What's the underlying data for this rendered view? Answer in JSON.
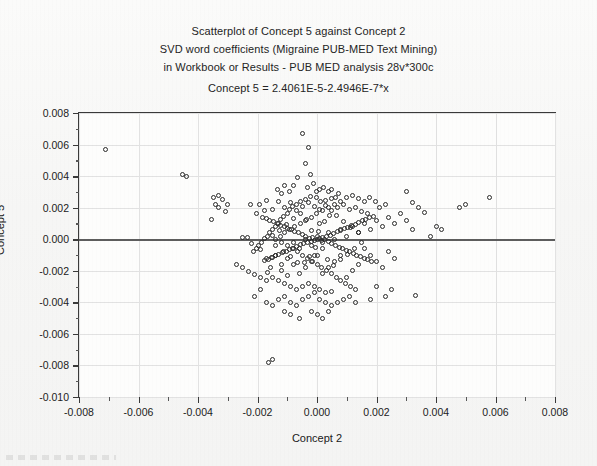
{
  "titles": {
    "line1": "Scatterplot of Concept 5 against Concept 2",
    "line2": "SVD word coefficients (Migraine PUB-MED Text Mining)",
    "line3": "in Workbook or  Results - PUB MED analysis 28v*300c",
    "equation": "Concept 5 = 2.4061E-5-2.4946E-7*x"
  },
  "chart_data": {
    "type": "scatter",
    "title": "Scatterplot of Concept 5 against Concept 2",
    "subtitle": "SVD word coefficients (Migraine PUB-MED Text Mining) in Workbook or  Results - PUB MED analysis 28v*300c",
    "annotation": "Concept 5 = 2.4061E-5-2.4946E-7*x",
    "xlabel": "Concept 2",
    "ylabel": "Concept 5",
    "xlim": [
      -0.008,
      0.008
    ],
    "ylim": [
      -0.01,
      0.008
    ],
    "xticks": [
      -0.008,
      -0.006,
      -0.004,
      -0.002,
      0.0,
      0.002,
      0.004,
      0.006,
      0.008
    ],
    "yticks": [
      0.008,
      0.006,
      0.004,
      0.002,
      0.0,
      -0.002,
      -0.004,
      -0.006,
      -0.008,
      -0.01
    ],
    "xticklabels": [
      "-0.008",
      "-0.006",
      "-0.004",
      "-0.002",
      "0.000",
      "0.002",
      "0.004",
      "0.006",
      "0.008"
    ],
    "yticklabels": [
      "0.008",
      "0.006",
      "0.004",
      "0.002",
      "0.000",
      "-0.002",
      "-0.004",
      "-0.006",
      "-0.008",
      "-0.010"
    ],
    "grid": true,
    "legend": false,
    "minor_ticks": true,
    "marker": "open-circle",
    "marker_color": "#2a2a2a",
    "fit_line": {
      "intercept": 2.4061e-05,
      "slope": -2.4946e-07,
      "color": "#5d5d5d",
      "label": "Concept 5 = 2.4061E-5-2.4946E-7*x"
    },
    "n_points": 300,
    "points": [
      [
        -0.0071,
        0.00568
      ],
      [
        -0.00452,
        0.00408
      ],
      [
        -0.0044,
        0.004
      ],
      [
        -0.0033,
        0.0028
      ],
      [
        -0.00348,
        0.00262
      ],
      [
        -0.00318,
        0.00252
      ],
      [
        -0.00342,
        0.00222
      ],
      [
        -0.003,
        0.00222
      ],
      [
        -0.00222,
        0.00222
      ],
      [
        -0.0033,
        0.002
      ],
      [
        -0.00308,
        0.00178
      ],
      [
        -0.00356,
        0.00128
      ],
      [
        -0.00252,
        0.00012
      ],
      [
        -0.00232,
        8e-05
      ],
      [
        -0.0022,
        -0.0003
      ],
      [
        -0.0019,
        -0.00062
      ],
      [
        -0.00148,
        -0.00118
      ],
      [
        -0.0017,
        -0.00122
      ],
      [
        -0.00156,
        -0.00182
      ],
      [
        -0.0012,
        -0.002
      ],
      [
        -0.00168,
        -0.00212
      ],
      [
        -0.001,
        -0.00228
      ],
      [
        -0.00192,
        0.00218
      ],
      [
        -0.0017,
        0.00248
      ],
      [
        -0.00178,
        0.00182
      ],
      [
        -0.00202,
        0.0016
      ],
      [
        -0.00148,
        0.00188
      ],
      [
        -0.00128,
        0.00238
      ],
      [
        -0.00118,
        0.00292
      ],
      [
        -0.00132,
        0.00318
      ],
      [
        -0.00108,
        0.00338
      ],
      [
        -0.00092,
        0.003
      ],
      [
        -0.0008,
        0.00338
      ],
      [
        -0.00066,
        0.00392
      ],
      [
        -0.00048,
        0.00668
      ],
      [
        -0.0003,
        0.00582
      ],
      [
        -0.0004,
        0.0048
      ],
      [
        -0.00022,
        0.00412
      ],
      [
        -0.00032,
        0.0033
      ],
      [
        -0.00012,
        0.00352
      ],
      [
        -2e-05,
        0.003
      ],
      [
        0.0001,
        0.00318
      ],
      [
        0.00022,
        0.0033
      ],
      [
        0.00038,
        0.003
      ],
      [
        0.0005,
        0.00318
      ],
      [
        0.00062,
        0.00262
      ],
      [
        0.00072,
        0.00288
      ],
      [
        0.00048,
        0.0026
      ],
      [
        0.0003,
        0.00248
      ],
      [
        0.00012,
        0.0024
      ],
      [
        -2e-05,
        0.00262
      ],
      [
        -0.00022,
        0.00272
      ],
      [
        -0.0004,
        0.00252
      ],
      [
        -0.00056,
        0.00238
      ],
      [
        -0.0007,
        0.00222
      ],
      [
        -0.00082,
        0.00208
      ],
      [
        -0.00092,
        0.00188
      ],
      [
        -0.001,
        0.00162
      ],
      [
        -0.00112,
        0.00142
      ],
      [
        -0.00122,
        0.00122
      ],
      [
        -0.0013,
        0.00102
      ],
      [
        -0.0014,
        0.00082
      ],
      [
        -0.0015,
        0.00062
      ],
      [
        -0.00158,
        0.00042
      ],
      [
        -0.00166,
        0.0002
      ],
      [
        -0.00176,
        2e-05
      ],
      [
        -0.00186,
        -0.00018
      ],
      [
        -0.00196,
        -0.00038
      ],
      [
        -0.00204,
        -0.00058
      ],
      [
        -0.00212,
        -0.00078
      ],
      [
        -0.0011,
        0.002
      ],
      [
        -0.0009,
        0.0023
      ],
      [
        -0.0007,
        0.0018
      ],
      [
        -0.0005,
        0.0021
      ],
      [
        -0.0003,
        0.0023
      ],
      [
        -0.0001,
        0.0021
      ],
      [
        0.0001,
        0.0019
      ],
      [
        0.0003,
        0.00212
      ],
      [
        0.0005,
        0.00182
      ],
      [
        0.0007,
        0.00198
      ],
      [
        0.0009,
        0.00218
      ],
      [
        0.0011,
        0.0019
      ],
      [
        0.0013,
        0.00202
      ],
      [
        0.0015,
        0.00178
      ],
      [
        0.0017,
        0.0016
      ],
      [
        0.0019,
        0.00142
      ],
      [
        0.0021,
        0.002
      ],
      [
        0.0023,
        0.00218
      ],
      [
        0.00198,
        0.00242
      ],
      [
        0.00178,
        0.00262
      ],
      [
        0.00158,
        0.00238
      ],
      [
        0.00138,
        0.00258
      ],
      [
        0.00118,
        0.00278
      ],
      [
        0.00098,
        0.00262
      ],
      [
        0.00078,
        0.0024
      ],
      [
        0.00058,
        0.00222
      ],
      [
        0.00038,
        0.002
      ],
      [
        0.00018,
        0.0018
      ],
      [
        -2e-05,
        0.0016
      ],
      [
        -0.0002,
        0.0014
      ],
      [
        -0.00038,
        0.0012
      ],
      [
        -0.00056,
        0.001
      ],
      [
        -0.00074,
        0.0008
      ],
      [
        -0.00092,
        0.0006
      ],
      [
        -0.00108,
        0.0004
      ],
      [
        -0.00124,
        0.0002
      ],
      [
        -0.0014,
        0.0
      ],
      [
        -0.0012,
        -0.0002
      ],
      [
        -0.001,
        -0.0004
      ],
      [
        -0.00082,
        -0.0006
      ],
      [
        -0.00064,
        -0.0008
      ],
      [
        -0.00048,
        -0.001
      ],
      [
        -0.00032,
        -0.0012
      ],
      [
        -0.00016,
        -0.0014
      ],
      [
        0.0,
        -0.0016
      ],
      [
        0.00016,
        -0.0018
      ],
      [
        0.00032,
        -0.002
      ],
      [
        0.00048,
        -0.0022
      ],
      [
        0.00064,
        -0.0024
      ],
      [
        0.0008,
        -0.0026
      ],
      [
        0.00096,
        -0.0028
      ],
      [
        0.00112,
        -0.003
      ],
      [
        0.00128,
        -0.0032
      ],
      [
        0.0005,
        -0.0033
      ],
      [
        0.0003,
        -0.0034
      ],
      [
        0.0001,
        -0.0032
      ],
      [
        -0.0001,
        -0.003
      ],
      [
        -0.0003,
        -0.0028
      ],
      [
        -0.0005,
        -0.003
      ],
      [
        -0.0007,
        -0.0032
      ],
      [
        -0.0009,
        -0.003
      ],
      [
        -0.0011,
        -0.0028
      ],
      [
        -0.0013,
        -0.0026
      ],
      [
        -0.0015,
        -0.0024
      ],
      [
        -0.0017,
        -0.00262
      ],
      [
        -0.0019,
        -0.00242
      ],
      [
        -0.0021,
        -0.00222
      ],
      [
        -0.0023,
        -0.00202
      ],
      [
        -0.0025,
        -0.0018
      ],
      [
        -0.0027,
        -0.0016
      ],
      [
        -0.0019,
        -0.0032
      ],
      [
        -0.0021,
        -0.0036
      ],
      [
        -0.0017,
        -0.004
      ],
      [
        -0.0015,
        -0.00418
      ],
      [
        -0.0013,
        -0.0038
      ],
      [
        -0.0011,
        -0.00362
      ],
      [
        -0.0009,
        -0.004
      ],
      [
        -0.0007,
        -0.0042
      ],
      [
        -0.0005,
        -0.0038
      ],
      [
        -0.0003,
        -0.0036
      ],
      [
        -0.0001,
        -0.0034
      ],
      [
        0.0001,
        -0.0038
      ],
      [
        0.0003,
        -0.004
      ],
      [
        0.0005,
        -0.0042
      ],
      [
        0.0007,
        -0.004
      ],
      [
        0.0009,
        -0.0038
      ],
      [
        0.0011,
        -0.0036
      ],
      [
        0.0013,
        -0.004
      ],
      [
        0.0018,
        -0.0038
      ],
      [
        0.0023,
        -0.0036
      ],
      [
        0.0033,
        -0.00358
      ],
      [
        -0.00162,
        -0.0078
      ],
      [
        -0.00148,
        -0.00762
      ],
      [
        -0.0006,
        -0.005
      ],
      [
        -0.0009,
        -0.0048
      ],
      [
        -0.0011,
        -0.0046
      ],
      [
        -0.0002,
        -0.0046
      ],
      [
        0.0,
        -0.0048
      ],
      [
        0.0002,
        -0.005
      ],
      [
        0.0004,
        -0.0046
      ],
      [
        0.002,
        -0.003
      ],
      [
        0.0025,
        -0.0032
      ],
      [
        0.0032,
        0.0006
      ],
      [
        0.0038,
        0.0002
      ],
      [
        0.004,
        0.0008
      ],
      [
        0.0042,
        0.0006
      ],
      [
        0.0048,
        0.002
      ],
      [
        0.005,
        0.0022
      ],
      [
        0.0058,
        0.00262
      ],
      [
        0.003,
        0.003
      ],
      [
        0.0032,
        0.0023
      ],
      [
        0.0034,
        0.002
      ],
      [
        0.0036,
        0.0017
      ],
      [
        0.003,
        0.0012
      ],
      [
        0.0028,
        0.0016
      ],
      [
        0.0026,
        0.001
      ],
      [
        0.0024,
        0.0014
      ],
      [
        0.0022,
        0.0008
      ],
      [
        0.002,
        0.0012
      ],
      [
        0.0018,
        0.0006
      ],
      [
        0.0016,
        0.001
      ],
      [
        0.0014,
        0.0004
      ],
      [
        0.0012,
        0.0008
      ],
      [
        0.001,
        0.0002
      ],
      [
        0.0008,
        0.0006
      ],
      [
        0.0006,
        0.0
      ],
      [
        0.0004,
        0.0004
      ],
      [
        0.0002,
        -0.0002
      ],
      [
        0.0,
        0.0002
      ],
      [
        -0.0002,
        -0.0004
      ],
      [
        -0.0004,
        0.0
      ],
      [
        -0.0006,
        -0.0006
      ],
      [
        -0.0008,
        -0.0002
      ],
      [
        0.0016,
        -0.0006
      ],
      [
        0.0018,
        -0.001
      ],
      [
        0.002,
        -0.0014
      ],
      [
        0.0022,
        -0.0018
      ],
      [
        0.0024,
        -0.0008
      ],
      [
        0.0026,
        -0.0012
      ],
      [
        0.0014,
        -0.0016
      ],
      [
        0.0012,
        -0.002
      ],
      [
        0.001,
        -0.0024
      ],
      [
        0.0008,
        -0.001
      ],
      [
        0.0006,
        -0.0014
      ],
      [
        0.0004,
        -0.0018
      ],
      [
        0.0002,
        -0.0022
      ],
      [
        0.0,
        -0.001
      ],
      [
        -0.0002,
        -0.0014
      ],
      [
        -0.0004,
        -0.0018
      ],
      [
        -0.0006,
        -0.0022
      ],
      [
        -0.0008,
        -0.0016
      ],
      [
        -0.001,
        -0.0012
      ],
      [
        -0.0012,
        -0.0016
      ],
      [
        -0.0014,
        -0.001
      ],
      [
        0.0,
        0.0
      ],
      [
        8e-05,
        6e-05
      ],
      [
        -8e-05,
        -6e-05
      ],
      [
        0.00014,
        -0.0001
      ],
      [
        -0.00014,
        0.0001
      ],
      [
        0.0002,
        0.00014
      ],
      [
        -0.0002,
        -0.00014
      ],
      [
        0.00026,
        -4e-05
      ],
      [
        -0.00026,
        4e-05
      ],
      [
        0.00032,
        0.0002
      ],
      [
        -0.00032,
        -0.0002
      ],
      [
        0.00038,
        -0.00016
      ],
      [
        -0.00038,
        0.00016
      ],
      [
        0.00044,
        0.00026
      ],
      [
        -0.00044,
        -0.00026
      ],
      [
        0.0005,
        -0.0003
      ],
      [
        -0.0005,
        0.0003
      ],
      [
        0.00056,
        0.00036
      ],
      [
        -0.00056,
        -0.00036
      ],
      [
        0.00062,
        -0.0004
      ],
      [
        -0.00062,
        0.0004
      ],
      [
        0.00068,
        0.00046
      ],
      [
        -0.00068,
        -0.00046
      ],
      [
        0.00074,
        -0.0005
      ],
      [
        -0.00074,
        0.0005
      ],
      [
        0.0008,
        0.00056
      ],
      [
        -0.0008,
        -0.00056
      ],
      [
        0.00086,
        -0.0006
      ],
      [
        -0.00086,
        0.0006
      ],
      [
        0.00092,
        0.00066
      ],
      [
        -0.00092,
        -0.00066
      ],
      [
        0.00098,
        -0.0007
      ],
      [
        -0.00098,
        0.0007
      ],
      [
        0.00104,
        0.00076
      ],
      [
        -0.00104,
        -0.00076
      ],
      [
        0.0011,
        -0.0008
      ],
      [
        -0.0011,
        0.0008
      ],
      [
        0.00116,
        0.00086
      ],
      [
        -0.00116,
        -0.00086
      ],
      [
        0.00122,
        -0.0009
      ],
      [
        -0.00122,
        0.0009
      ],
      [
        0.00128,
        0.00096
      ],
      [
        -0.00128,
        -0.00096
      ],
      [
        0.00134,
        -0.001
      ],
      [
        -0.00134,
        0.001
      ],
      [
        0.0014,
        0.00106
      ],
      [
        -0.0014,
        -0.00106
      ],
      [
        0.00146,
        -0.0011
      ],
      [
        -0.00146,
        0.0011
      ],
      [
        0.00152,
        0.00116
      ],
      [
        -0.00152,
        -0.00116
      ],
      [
        0.00158,
        -0.0012
      ],
      [
        -0.00158,
        0.0012
      ],
      [
        0.00164,
        0.00126
      ],
      [
        -0.00164,
        -0.00126
      ],
      [
        0.0017,
        -0.0013
      ],
      [
        -0.0017,
        0.0013
      ],
      [
        0.00176,
        0.00136
      ],
      [
        -0.00176,
        -0.00136
      ],
      [
        0.00182,
        -0.0014
      ],
      [
        -0.00182,
        0.0014
      ],
      [
        0.0001,
        0.001
      ],
      [
        -0.0001,
        -0.001
      ],
      [
        4e-05,
        0.0005
      ],
      [
        -4e-05,
        -0.0005
      ],
      [
        0.00018,
        -0.00056
      ],
      [
        -0.00018,
        0.00056
      ],
      [
        0.00024,
        0.0011
      ],
      [
        -0.00024,
        -0.0011
      ],
      [
        0.00036,
        -0.00126
      ],
      [
        -0.00036,
        0.00126
      ],
      [
        0.00042,
        0.0015
      ],
      [
        -0.00042,
        -0.0015
      ],
      [
        0.00054,
        -0.00166
      ],
      [
        -0.00054,
        0.00166
      ],
      [
        0.00066,
        0.00148
      ],
      [
        -0.00066,
        -0.00148
      ],
      [
        0.00078,
        -0.0013
      ],
      [
        -0.00078,
        0.0013
      ],
      [
        0.0009,
        0.00112
      ],
      [
        -0.0009,
        -0.00112
      ],
      [
        0.00102,
        -0.00094
      ],
      [
        -0.00102,
        0.00094
      ],
      [
        0.00114,
        0.00076
      ],
      [
        -0.00114,
        -0.00076
      ],
      [
        0.00126,
        -0.00058
      ],
      [
        -0.00126,
        0.00058
      ],
      [
        0.00138,
        0.0004
      ],
      [
        -0.00138,
        -0.0004
      ],
      [
        0.0015,
        -0.00022
      ],
      [
        -0.0015,
        0.00022
      ]
    ]
  },
  "axes": {
    "x_title": "Concept 2",
    "y_title": "Concept 5"
  }
}
